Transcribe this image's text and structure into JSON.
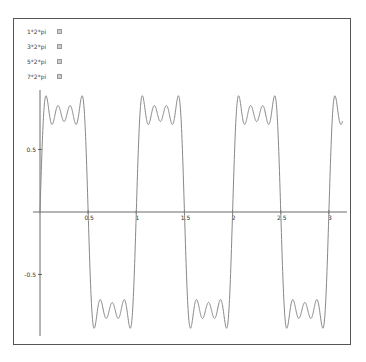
{
  "legend": {
    "items": [
      {
        "label": "1*2*pi",
        "checked": true
      },
      {
        "label": "3*2*pi",
        "checked": true
      },
      {
        "label": "5*2*pi",
        "checked": true
      },
      {
        "label": "7*2*pi",
        "checked": true
      }
    ]
  },
  "axes": {
    "x_ticks": [
      "0.5",
      "1",
      "1.5",
      "2",
      "2.5",
      "3"
    ],
    "y_ticks": [
      "0.5",
      "-0.5"
    ]
  },
  "colors": {
    "curve": "#888888",
    "axis": "#444444",
    "frame": "#555555"
  },
  "chart_data": {
    "type": "line",
    "title": "",
    "xlabel": "",
    "ylabel": "",
    "xlim": [
      0,
      3.15
    ],
    "ylim": [
      -0.95,
      0.95
    ],
    "x_ticks": [
      0.5,
      1,
      1.5,
      2,
      2.5,
      3
    ],
    "y_ticks": [
      0.5,
      -0.5
    ],
    "legend": [
      "1*2*pi",
      "3*2*pi",
      "5*2*pi",
      "7*2*pi"
    ],
    "legend_position": "upper left",
    "grid": false,
    "series": [
      {
        "name": "sum of harmonics 1,3,5,7 (×2π)",
        "x_range": [
          0,
          3.1416
        ],
        "harmonics": [
          1,
          3,
          5,
          7
        ],
        "plateau_peak": 0.92,
        "plateau_valley": 0.7,
        "period": 1
      }
    ]
  }
}
